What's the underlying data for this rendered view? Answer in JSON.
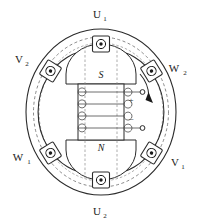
{
  "figure": {
    "title": "",
    "type": "machine-cross-section"
  },
  "colors": {
    "line": "#2b2b2b",
    "thin_line": "#4a4a4a",
    "dashed": "#6b6b6b",
    "background": "#ffffff",
    "text": "#1a1a1a"
  },
  "stator": {
    "outer_label": "stator-outer-ring",
    "bore_label": "stator-bore",
    "phase_labels": [
      {
        "id": "u1",
        "text": "U",
        "sub": "1",
        "position": "top",
        "x": 101,
        "y": 15
      },
      {
        "id": "v2",
        "text": "V",
        "sub": "2",
        "position": "top-left",
        "x": 20,
        "y": 60
      },
      {
        "id": "w2",
        "text": "W",
        "sub": "2",
        "position": "top-right",
        "x": 176,
        "y": 69
      },
      {
        "id": "w1",
        "text": "W",
        "sub": "1",
        "position": "bottom-left",
        "x": 21,
        "y": 158
      },
      {
        "id": "v1",
        "text": "V",
        "sub": "1",
        "position": "bottom-right",
        "x": 176,
        "y": 163
      },
      {
        "id": "u2",
        "text": "U",
        "sub": "2",
        "position": "bottom",
        "x": 101,
        "y": 212
      }
    ],
    "slots": [
      {
        "id": "slot-u1",
        "angle": -90,
        "current": "out-of-page"
      },
      {
        "id": "slot-v2",
        "angle": -150,
        "current": "out-of-page"
      },
      {
        "id": "slot-w2",
        "angle": -30,
        "current": "out-of-page"
      },
      {
        "id": "slot-w1",
        "angle": 150,
        "current": "out-of-page"
      },
      {
        "id": "slot-v1",
        "angle": 30,
        "current": "out-of-page"
      },
      {
        "id": "slot-u2",
        "angle": 90,
        "current": "out-of-page"
      }
    ],
    "slot_count": 6
  },
  "rotor": {
    "pole_north": "N",
    "pole_south": "S",
    "south_position": "top",
    "north_position": "bottom",
    "coil_turns": 4,
    "coil_label": "field-winding"
  },
  "terminals": {
    "positive": "+",
    "negative": "−",
    "positive_name": "positive-terminal",
    "negative_name": "negative-terminal"
  },
  "rotation": {
    "direction": "clockwise",
    "indicator": "rotation-arrow"
  }
}
